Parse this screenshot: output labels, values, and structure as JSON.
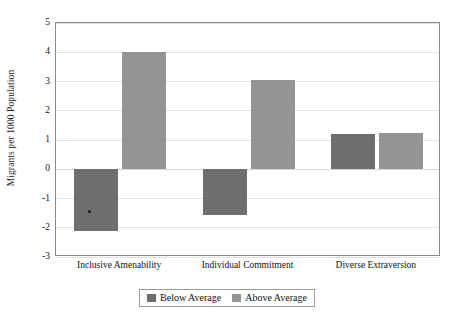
{
  "chart_data": {
    "type": "bar",
    "title": "",
    "xlabel": "",
    "ylabel": "Migrants per 1000 Population",
    "categories": [
      "Inclusive Amenability",
      "Individual Commitment",
      "Diverse Extraversion"
    ],
    "series": [
      {
        "name": "Below Average",
        "color": "#6e6e6e",
        "values": [
          -2.1,
          -1.55,
          1.2
        ]
      },
      {
        "name": "Above Average",
        "color": "#949494",
        "values": [
          4.0,
          3.05,
          1.25
        ]
      }
    ],
    "ylim": [
      -3,
      5
    ],
    "yticks": [
      5,
      4,
      3,
      2,
      1,
      0,
      -1,
      -2,
      -3
    ],
    "ytick_labels": [
      "5",
      "4",
      "3",
      "2",
      "1",
      "0",
      "-1",
      "-2",
      "-3"
    ],
    "grid": true,
    "legend_position": "bottom",
    "zero_line": 0
  },
  "legend": {
    "entries": [
      {
        "label": "Below Average",
        "color": "#6e6e6e"
      },
      {
        "label": "Above Average",
        "color": "#949494"
      }
    ]
  },
  "axes": {
    "frame_color": "#8a8a8a",
    "grid_color": "#e2e2e2"
  }
}
